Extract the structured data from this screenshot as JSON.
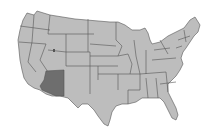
{
  "map": {
    "subject": "Contiguous United States",
    "highlighted_state": "Arizona",
    "colors": {
      "background": "#ffffff",
      "state_fill": "#bdbdbd",
      "border": "#555555",
      "highlight_fill": "#6e6e6e"
    }
  }
}
